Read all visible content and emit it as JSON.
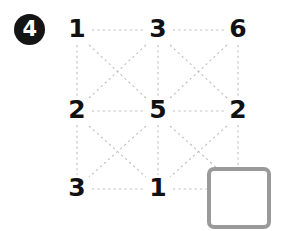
{
  "question": {
    "number": "4",
    "badge_color": "#151515",
    "badge_text_color": "#ffffff"
  },
  "grid": {
    "rows": [
      {
        "cells": [
          {
            "value": "1"
          },
          {
            "value": "3"
          },
          {
            "value": "6"
          }
        ]
      },
      {
        "cells": [
          {
            "value": "2"
          },
          {
            "value": "5"
          },
          {
            "value": "2"
          }
        ]
      },
      {
        "cells": [
          {
            "value": "3"
          },
          {
            "value": "1"
          },
          {
            "value": ""
          }
        ]
      }
    ],
    "missing_cell": {
      "row": 2,
      "col": 2,
      "value": ""
    },
    "number_color": "#111111",
    "connector_color": "#bfbfbf",
    "connector_style": "dotted"
  },
  "answer_box": {
    "value": "",
    "border_color": "#9a9a9a",
    "fill_color": "#ffffff"
  }
}
